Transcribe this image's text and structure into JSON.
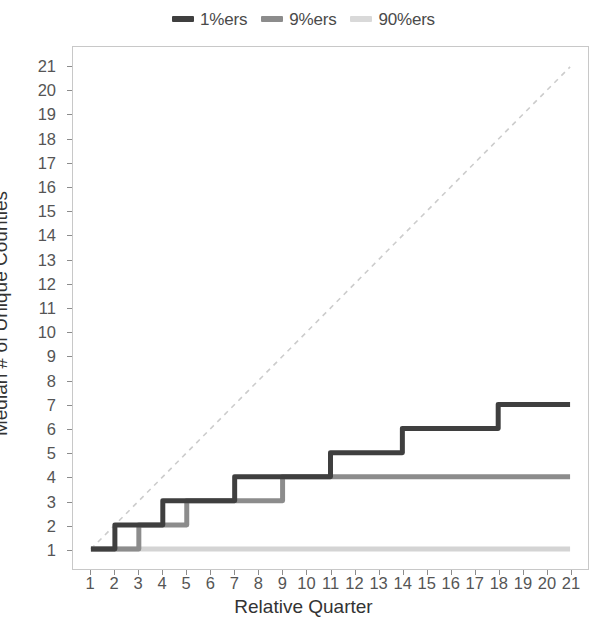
{
  "chart_data": {
    "type": "line",
    "title": "",
    "xlabel": "Relative Quarter",
    "ylabel": "Median # of Unique Counties",
    "xlim": [
      1,
      21
    ],
    "ylim": [
      1,
      21
    ],
    "grid": false,
    "legend_position": "top-center",
    "x": [
      1,
      2,
      3,
      4,
      5,
      6,
      7,
      8,
      9,
      10,
      11,
      12,
      13,
      14,
      15,
      16,
      17,
      18,
      19,
      20,
      21
    ],
    "xticks": [
      "1",
      "2",
      "3",
      "4",
      "5",
      "6",
      "7",
      "8",
      "9",
      "10",
      "11",
      "12",
      "13",
      "14",
      "15",
      "16",
      "17",
      "18",
      "19",
      "20",
      "21"
    ],
    "yticks": [
      "1",
      "2",
      "3",
      "4",
      "5",
      "6",
      "7",
      "8",
      "9",
      "10",
      "11",
      "12",
      "13",
      "14",
      "15",
      "16",
      "17",
      "18",
      "19",
      "20",
      "21"
    ],
    "series": [
      {
        "name": "1%ers",
        "color": "#3f3f3f",
        "width": 5,
        "values": [
          1,
          2,
          2,
          3,
          3,
          3,
          4,
          4,
          4,
          4,
          5,
          5,
          5,
          6,
          6,
          6,
          6,
          7,
          7,
          7,
          7
        ]
      },
      {
        "name": "9%ers",
        "color": "#8c8c8c",
        "width": 5,
        "values": [
          1,
          1,
          2,
          2,
          3,
          3,
          3,
          3,
          4,
          4,
          4,
          4,
          4,
          4,
          4,
          4,
          4,
          4,
          4,
          4,
          4
        ]
      },
      {
        "name": "90%ers",
        "color": "#d4d4d4",
        "width": 5,
        "values": [
          1,
          1,
          1,
          1,
          1,
          1,
          1,
          1,
          1,
          1,
          1,
          1,
          1,
          1,
          1,
          1,
          1,
          1,
          1,
          1,
          1
        ]
      }
    ],
    "reference_line": {
      "name": "identity-reference",
      "style": "dashed",
      "color": "#cccccc",
      "from": [
        1,
        1
      ],
      "to": [
        21,
        21
      ]
    },
    "annotations": []
  },
  "legend": {
    "entries": [
      {
        "label": "1%ers",
        "color": "#3f3f3f"
      },
      {
        "label": "9%ers",
        "color": "#8c8c8c"
      },
      {
        "label": "90%ers",
        "color": "#d4d4d4"
      }
    ]
  },
  "axes": {
    "x_title": "Relative Quarter",
    "y_title": "Median # of Unique Counties"
  }
}
